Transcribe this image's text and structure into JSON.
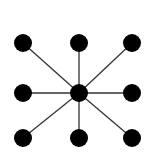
{
  "diagram": {
    "type": "star-graph",
    "background": "#ffffff",
    "node_color": "#000000",
    "edge_color": "#333333",
    "node_radius": 9,
    "center": {
      "id": "center",
      "x": 79,
      "y": 93
    },
    "nodes": [
      {
        "id": "top-left",
        "x": 23,
        "y": 43
      },
      {
        "id": "top-middle",
        "x": 79,
        "y": 43
      },
      {
        "id": "top-right",
        "x": 132,
        "y": 43
      },
      {
        "id": "middle-left",
        "x": 23,
        "y": 93
      },
      {
        "id": "middle-right",
        "x": 132,
        "y": 93
      },
      {
        "id": "bottom-left",
        "x": 23,
        "y": 138
      },
      {
        "id": "bottom-middle",
        "x": 79,
        "y": 138
      },
      {
        "id": "bottom-right",
        "x": 132,
        "y": 138
      }
    ]
  }
}
